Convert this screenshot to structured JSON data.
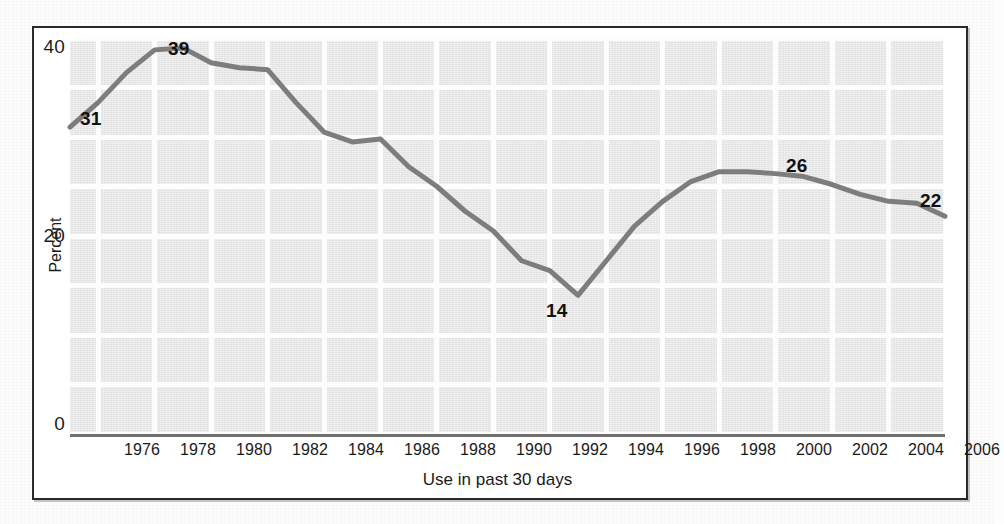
{
  "chart_data": {
    "type": "line",
    "title": "",
    "subtitle": "",
    "xlabel": "Use in past 30 days",
    "ylabel": "Percent",
    "xlim": [
      1975,
      2006
    ],
    "ylim": [
      0,
      40
    ],
    "xtick_labels": [
      "1976",
      "1978",
      "1980",
      "1982",
      "1984",
      "1986",
      "1988",
      "1990",
      "1992",
      "1994",
      "1996",
      "1998",
      "2000",
      "2002",
      "2004",
      "2006"
    ],
    "xticks": [
      1976,
      1978,
      1980,
      1982,
      1984,
      1986,
      1988,
      1990,
      1992,
      1994,
      1996,
      1998,
      2000,
      2002,
      2004,
      2006
    ],
    "ytick_labels": [
      "0",
      "20",
      "40"
    ],
    "yticks": [
      0,
      20,
      40
    ],
    "grid": "both, white lines on light gray panel",
    "grid_y_step": 5,
    "grid_x_step": 2,
    "legend": "none",
    "line_color": "#7d7d7d",
    "line_width": 5,
    "x": [
      1975,
      1976,
      1977,
      1978,
      1979,
      1980,
      1981,
      1982,
      1983,
      1984,
      1985,
      1986,
      1987,
      1988,
      1989,
      1990,
      1991,
      1992,
      1993,
      1994,
      1995,
      1996,
      1997,
      1998,
      1999,
      2000,
      2001,
      2002,
      2003,
      2004,
      2005,
      2006
    ],
    "series": [
      {
        "name": "Use in past 30 days",
        "values": [
          31,
          33.5,
          36.5,
          38.8,
          39,
          37.5,
          37,
          36.8,
          33.5,
          30.5,
          29.5,
          29.8,
          27,
          25,
          22.5,
          20.5,
          17.5,
          16.5,
          14,
          17.5,
          21,
          23.5,
          25.5,
          26.5,
          26.5,
          26.3,
          26,
          25.2,
          24.2,
          23.5,
          23.3,
          22
        ]
      }
    ],
    "annotations": [
      {
        "label": "31",
        "x": 1975,
        "y": 31,
        "note": "start of series"
      },
      {
        "label": "39",
        "x": 1978.6,
        "y": 39,
        "note": "peak"
      },
      {
        "label": "14",
        "x": 1992,
        "y": 14,
        "note": "trough"
      },
      {
        "label": "26",
        "x": 2000,
        "y": 26,
        "note": "secondary peak"
      },
      {
        "label": "22",
        "x": 2006,
        "y": 22,
        "note": "end of series"
      }
    ]
  },
  "axes": {
    "y_ticks": [
      {
        "label": "40",
        "top": 36
      },
      {
        "label": "20",
        "top": 225
      },
      {
        "label": "0",
        "top": 413
      }
    ],
    "x_ticks": [
      {
        "label": "1976",
        "left": 142
      },
      {
        "label": "1978",
        "left": 198
      },
      {
        "label": "1980",
        "left": 254
      },
      {
        "label": "1982",
        "left": 310
      },
      {
        "label": "1984",
        "left": 366
      },
      {
        "label": "1986",
        "left": 422
      },
      {
        "label": "1988",
        "left": 478
      },
      {
        "label": "1990",
        "left": 534
      },
      {
        "label": "1992",
        "left": 590
      },
      {
        "label": "1994",
        "left": 646
      },
      {
        "label": "1996",
        "left": 702
      },
      {
        "label": "1998",
        "left": 758
      },
      {
        "label": "2000",
        "left": 814
      },
      {
        "label": "2002",
        "left": 870
      },
      {
        "label": "2004",
        "left": 926
      },
      {
        "label": "2006",
        "left": 982
      }
    ]
  },
  "annotation_positions": [
    {
      "label": "31",
      "left": 80,
      "top": 108
    },
    {
      "label": "39",
      "left": 168,
      "top": 38
    },
    {
      "label": "14",
      "left": 546,
      "top": 300
    },
    {
      "label": "26",
      "left": 786,
      "top": 155
    },
    {
      "label": "22",
      "left": 920,
      "top": 190
    }
  ],
  "colors": {
    "panel": "#e9e9e9",
    "grid": "#fdfdfd",
    "line": "#7d7d7d",
    "frame": "#2a2a2a",
    "text": "#1a1a1a"
  }
}
